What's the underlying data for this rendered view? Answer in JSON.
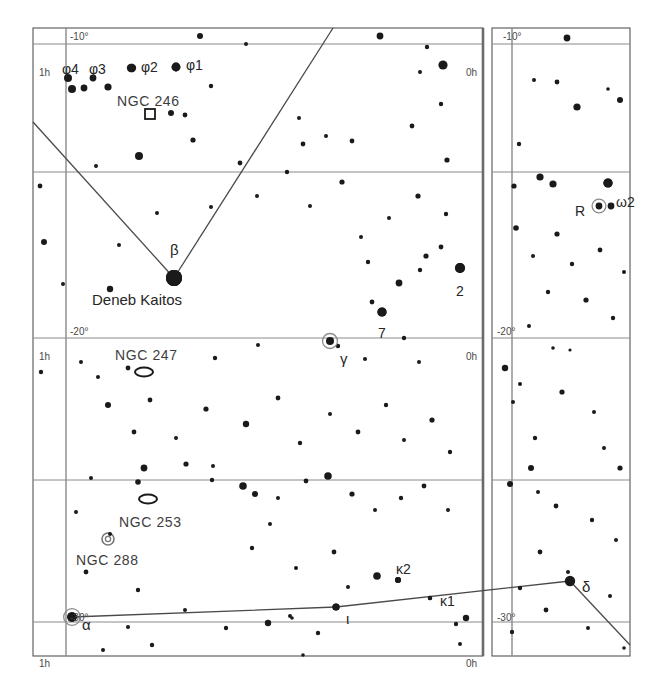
{
  "chart_data": {
    "type": "scatter",
    "xlabel": "Right Ascension",
    "ylabel": "Declination",
    "grid": true,
    "legend_position": "none",
    "xlim": [
      "1h",
      "0h"
    ],
    "ylim": [
      "-10",
      "-30"
    ],
    "panels": [
      {
        "name": "left-panel",
        "x": 33,
        "y": 28,
        "width": 450,
        "height": 628,
        "ra_labels": [
          "1h",
          "0h"
        ],
        "dec_labels": [
          "-10°",
          "-20°",
          "-30°"
        ]
      },
      {
        "name": "right-panel",
        "x": 492,
        "y": 28,
        "width": 138,
        "height": 628,
        "ra_labels": [
          "0h"
        ],
        "dec_labels": [
          "-10°",
          "-20°",
          "-30°"
        ]
      }
    ],
    "gridlines_horizontal": [
      {
        "label": "-10°",
        "y": 44
      },
      {
        "label": "",
        "y": 172
      },
      {
        "label": "-20°",
        "y": 338
      },
      {
        "label": "",
        "y": 480
      },
      {
        "label": "-30°",
        "y": 622
      }
    ],
    "gridlines_vertical": [
      {
        "label": "1h",
        "x": 66
      },
      {
        "label": "0h",
        "x": 466
      },
      {
        "label": "0h",
        "x": 512
      }
    ],
    "stars": [
      {
        "x": 72,
        "y": 89,
        "r": 4.0
      },
      {
        "x": 84,
        "y": 88,
        "r": 3.4
      },
      {
        "x": 108,
        "y": 87,
        "r": 3.6
      },
      {
        "x": 132,
        "y": 68,
        "r": 4.2
      },
      {
        "x": 176,
        "y": 67,
        "r": 4.4
      },
      {
        "x": 211,
        "y": 86,
        "r": 2.2
      },
      {
        "x": 200,
        "y": 36,
        "r": 3.0
      },
      {
        "x": 185,
        "y": 115,
        "r": 2.4
      },
      {
        "x": 171,
        "y": 113,
        "r": 3.0
      },
      {
        "x": 193,
        "y": 140,
        "r": 2.6
      },
      {
        "x": 246,
        "y": 44,
        "r": 2.0
      },
      {
        "x": 299,
        "y": 118,
        "r": 2.0
      },
      {
        "x": 303,
        "y": 144,
        "r": 2.4
      },
      {
        "x": 326,
        "y": 136,
        "r": 2.0
      },
      {
        "x": 380,
        "y": 36,
        "r": 3.4
      },
      {
        "x": 427,
        "y": 47,
        "r": 2.2
      },
      {
        "x": 443,
        "y": 65,
        "r": 4.6
      },
      {
        "x": 420,
        "y": 72,
        "r": 2.0
      },
      {
        "x": 139,
        "y": 156,
        "r": 4.0
      },
      {
        "x": 96,
        "y": 166,
        "r": 2.0
      },
      {
        "x": 40,
        "y": 186,
        "r": 2.4
      },
      {
        "x": 44,
        "y": 242,
        "r": 3.0
      },
      {
        "x": 63,
        "y": 284,
        "r": 2.0
      },
      {
        "x": 110,
        "y": 289,
        "r": 3.2
      },
      {
        "x": 119,
        "y": 245,
        "r": 2.0
      },
      {
        "x": 157,
        "y": 213,
        "r": 2.0
      },
      {
        "x": 174,
        "y": 278,
        "r": 8.0
      },
      {
        "x": 211,
        "y": 207,
        "r": 2.0
      },
      {
        "x": 240,
        "y": 163,
        "r": 2.4
      },
      {
        "x": 257,
        "y": 196,
        "r": 2.0
      },
      {
        "x": 287,
        "y": 172,
        "r": 2.2
      },
      {
        "x": 310,
        "y": 206,
        "r": 2.0
      },
      {
        "x": 342,
        "y": 182,
        "r": 2.6
      },
      {
        "x": 352,
        "y": 141,
        "r": 2.4
      },
      {
        "x": 361,
        "y": 237,
        "r": 2.0
      },
      {
        "x": 368,
        "y": 262,
        "r": 2.2
      },
      {
        "x": 372,
        "y": 302,
        "r": 2.4
      },
      {
        "x": 382,
        "y": 312,
        "r": 4.6
      },
      {
        "x": 399,
        "y": 283,
        "r": 3.4
      },
      {
        "x": 420,
        "y": 270,
        "r": 2.2
      },
      {
        "x": 426,
        "y": 256,
        "r": 2.6
      },
      {
        "x": 441,
        "y": 247,
        "r": 2.4
      },
      {
        "x": 460,
        "y": 268,
        "r": 5.0
      },
      {
        "x": 446,
        "y": 214,
        "r": 2.2
      },
      {
        "x": 418,
        "y": 196,
        "r": 2.6
      },
      {
        "x": 389,
        "y": 218,
        "r": 2.0
      },
      {
        "x": 447,
        "y": 160,
        "r": 2.6
      },
      {
        "x": 412,
        "y": 126,
        "r": 2.4
      },
      {
        "x": 441,
        "y": 104,
        "r": 2.2
      },
      {
        "x": 338,
        "y": 346,
        "r": 2.2
      },
      {
        "x": 404,
        "y": 338,
        "r": 2.2
      },
      {
        "x": 419,
        "y": 362,
        "r": 2.0
      },
      {
        "x": 365,
        "y": 359,
        "r": 2.0
      },
      {
        "x": 258,
        "y": 345,
        "r": 2.0
      },
      {
        "x": 215,
        "y": 358,
        "r": 2.2
      },
      {
        "x": 128,
        "y": 368,
        "r": 2.4
      },
      {
        "x": 98,
        "y": 377,
        "r": 2.0
      },
      {
        "x": 81,
        "y": 362,
        "r": 2.0
      },
      {
        "x": 41,
        "y": 372,
        "r": 2.2
      },
      {
        "x": 108,
        "y": 405,
        "r": 3.0
      },
      {
        "x": 150,
        "y": 400,
        "r": 2.4
      },
      {
        "x": 134,
        "y": 432,
        "r": 2.4
      },
      {
        "x": 176,
        "y": 438,
        "r": 2.0
      },
      {
        "x": 206,
        "y": 409,
        "r": 2.6
      },
      {
        "x": 246,
        "y": 424,
        "r": 3.2
      },
      {
        "x": 278,
        "y": 398,
        "r": 2.4
      },
      {
        "x": 300,
        "y": 443,
        "r": 2.2
      },
      {
        "x": 330,
        "y": 414,
        "r": 2.0
      },
      {
        "x": 358,
        "y": 432,
        "r": 2.4
      },
      {
        "x": 386,
        "y": 405,
        "r": 2.2
      },
      {
        "x": 404,
        "y": 440,
        "r": 2.0
      },
      {
        "x": 432,
        "y": 420,
        "r": 2.6
      },
      {
        "x": 450,
        "y": 452,
        "r": 2.2
      },
      {
        "x": 144,
        "y": 468,
        "r": 3.4
      },
      {
        "x": 186,
        "y": 464,
        "r": 2.6
      },
      {
        "x": 213,
        "y": 466,
        "r": 2.0
      },
      {
        "x": 91,
        "y": 478,
        "r": 2.0
      },
      {
        "x": 138,
        "y": 482,
        "r": 2.8
      },
      {
        "x": 212,
        "y": 480,
        "r": 2.2
      },
      {
        "x": 243,
        "y": 486,
        "r": 3.8
      },
      {
        "x": 255,
        "y": 494,
        "r": 3.0
      },
      {
        "x": 278,
        "y": 498,
        "r": 2.0
      },
      {
        "x": 306,
        "y": 481,
        "r": 2.4
      },
      {
        "x": 328,
        "y": 476,
        "r": 3.8
      },
      {
        "x": 352,
        "y": 494,
        "r": 2.6
      },
      {
        "x": 375,
        "y": 510,
        "r": 2.0
      },
      {
        "x": 401,
        "y": 498,
        "r": 2.2
      },
      {
        "x": 424,
        "y": 486,
        "r": 2.4
      },
      {
        "x": 448,
        "y": 510,
        "r": 2.0
      },
      {
        "x": 76,
        "y": 512,
        "r": 2.0
      },
      {
        "x": 86,
        "y": 572,
        "r": 2.4
      },
      {
        "x": 138,
        "y": 590,
        "r": 2.2
      },
      {
        "x": 110,
        "y": 534,
        "r": 2.0
      },
      {
        "x": 252,
        "y": 548,
        "r": 2.2
      },
      {
        "x": 270,
        "y": 524,
        "r": 2.0
      },
      {
        "x": 296,
        "y": 568,
        "r": 2.0
      },
      {
        "x": 334,
        "y": 552,
        "r": 2.4
      },
      {
        "x": 348,
        "y": 587,
        "r": 2.0
      },
      {
        "x": 377,
        "y": 576,
        "r": 3.8
      },
      {
        "x": 398,
        "y": 580,
        "r": 3.0
      },
      {
        "x": 430,
        "y": 598,
        "r": 2.2
      },
      {
        "x": 336,
        "y": 607,
        "r": 3.6
      },
      {
        "x": 185,
        "y": 610,
        "r": 2.0
      },
      {
        "x": 128,
        "y": 627,
        "r": 2.0
      },
      {
        "x": 72,
        "y": 617,
        "r": 4.8
      },
      {
        "x": 226,
        "y": 628,
        "r": 2.2
      },
      {
        "x": 268,
        "y": 623,
        "r": 3.2
      },
      {
        "x": 318,
        "y": 633,
        "r": 2.2
      },
      {
        "x": 290,
        "y": 616,
        "r": 2.0
      },
      {
        "x": 292,
        "y": 618,
        "r": 1.8
      },
      {
        "x": 456,
        "y": 624,
        "r": 2.2
      },
      {
        "x": 466,
        "y": 618,
        "r": 3.2
      },
      {
        "x": 103,
        "y": 650,
        "r": 2.0
      },
      {
        "x": 152,
        "y": 645,
        "r": 2.2
      },
      {
        "x": 303,
        "y": 655,
        "r": 1.8
      },
      {
        "x": 460,
        "y": 644,
        "r": 2.0
      },
      {
        "x": 567,
        "y": 38,
        "r": 3.4
      },
      {
        "x": 534,
        "y": 80,
        "r": 2.0
      },
      {
        "x": 557,
        "y": 82,
        "r": 2.4
      },
      {
        "x": 608,
        "y": 89,
        "r": 1.8
      },
      {
        "x": 620,
        "y": 100,
        "r": 3.0
      },
      {
        "x": 577,
        "y": 107,
        "r": 3.6
      },
      {
        "x": 519,
        "y": 144,
        "r": 2.2
      },
      {
        "x": 514,
        "y": 186,
        "r": 2.6
      },
      {
        "x": 540,
        "y": 177,
        "r": 3.6
      },
      {
        "x": 553,
        "y": 184,
        "r": 3.6
      },
      {
        "x": 608,
        "y": 183,
        "r": 4.6
      },
      {
        "x": 611,
        "y": 206,
        "r": 3.4
      },
      {
        "x": 516,
        "y": 228,
        "r": 2.8
      },
      {
        "x": 557,
        "y": 234,
        "r": 2.6
      },
      {
        "x": 533,
        "y": 256,
        "r": 2.0
      },
      {
        "x": 572,
        "y": 264,
        "r": 2.2
      },
      {
        "x": 600,
        "y": 250,
        "r": 2.4
      },
      {
        "x": 624,
        "y": 272,
        "r": 2.0
      },
      {
        "x": 548,
        "y": 292,
        "r": 2.2
      },
      {
        "x": 586,
        "y": 300,
        "r": 2.6
      },
      {
        "x": 613,
        "y": 318,
        "r": 2.2
      },
      {
        "x": 529,
        "y": 326,
        "r": 2.0
      },
      {
        "x": 553,
        "y": 348,
        "r": 1.8
      },
      {
        "x": 570,
        "y": 350,
        "r": 1.6
      },
      {
        "x": 505,
        "y": 368,
        "r": 3.2
      },
      {
        "x": 520,
        "y": 384,
        "r": 2.0
      },
      {
        "x": 562,
        "y": 392,
        "r": 2.6
      },
      {
        "x": 513,
        "y": 402,
        "r": 2.0
      },
      {
        "x": 594,
        "y": 412,
        "r": 2.0
      },
      {
        "x": 535,
        "y": 438,
        "r": 2.2
      },
      {
        "x": 604,
        "y": 448,
        "r": 2.0
      },
      {
        "x": 531,
        "y": 468,
        "r": 3.0
      },
      {
        "x": 620,
        "y": 468,
        "r": 2.6
      },
      {
        "x": 510,
        "y": 484,
        "r": 3.0
      },
      {
        "x": 538,
        "y": 492,
        "r": 2.0
      },
      {
        "x": 556,
        "y": 506,
        "r": 2.4
      },
      {
        "x": 592,
        "y": 520,
        "r": 2.2
      },
      {
        "x": 616,
        "y": 540,
        "r": 2.0
      },
      {
        "x": 540,
        "y": 552,
        "r": 2.4
      },
      {
        "x": 568,
        "y": 572,
        "r": 2.0
      },
      {
        "x": 520,
        "y": 588,
        "r": 2.2
      },
      {
        "x": 610,
        "y": 596,
        "r": 2.0
      },
      {
        "x": 546,
        "y": 610,
        "r": 2.4
      },
      {
        "x": 588,
        "y": 628,
        "r": 2.0
      },
      {
        "x": 512,
        "y": 632,
        "r": 2.2
      },
      {
        "x": 624,
        "y": 648,
        "r": 1.8
      }
    ],
    "labeled_stars": [
      {
        "name": "φ4",
        "x": 68,
        "y": 78,
        "label_dx": -6,
        "label_dy": -16,
        "r": 4.0
      },
      {
        "name": "φ3",
        "x": 93,
        "y": 78,
        "label_dx": -4,
        "label_dy": -16,
        "r": 3.4
      },
      {
        "name": "φ2",
        "x": 131,
        "y": 68,
        "label_dx": 10,
        "label_dy": -8,
        "r": 4.2
      },
      {
        "name": "φ1",
        "x": 176,
        "y": 67,
        "label_dx": 10,
        "label_dy": -9,
        "r": 4.4
      },
      {
        "name": "β",
        "x": 174,
        "y": 278,
        "label_dx": -4,
        "label_dy": -36,
        "r": 8.0
      },
      {
        "name": "Deneb Kaitos",
        "x": 174,
        "y": 278,
        "label_dx": -82,
        "label_dy": 14,
        "r": 8.0
      },
      {
        "name": "7",
        "x": 382,
        "y": 312,
        "label_dx": -4,
        "label_dy": 14,
        "r": 4.6
      },
      {
        "name": "2",
        "x": 460,
        "y": 268,
        "label_dx": -4,
        "label_dy": 16,
        "r": 5.0
      },
      {
        "name": "γ",
        "x": 330,
        "y": 341,
        "label_dx": 10,
        "label_dy": 10,
        "r": 4.0,
        "marker": "circled"
      },
      {
        "name": "κ2",
        "x": 398,
        "y": 580,
        "label_dx": -2,
        "label_dy": -18,
        "r": 3.0
      },
      {
        "name": "κ1",
        "x": 430,
        "y": 598,
        "label_dx": 10,
        "label_dy": -4,
        "r": 2.2
      },
      {
        "name": "ι",
        "x": 336,
        "y": 607,
        "label_dx": 10,
        "label_dy": 4,
        "r": 3.6
      },
      {
        "name": "α",
        "x": 72,
        "y": 617,
        "label_dx": 10,
        "label_dy": 0,
        "r": 4.8,
        "marker": "circled"
      },
      {
        "name": "δ",
        "x": 570,
        "y": 581,
        "label_dx": 12,
        "label_dy": -2,
        "r": 5.2
      },
      {
        "name": "R",
        "x": 599,
        "y": 206,
        "label_dx": -24,
        "label_dy": -2,
        "r": 3.4,
        "marker": "circled"
      },
      {
        "name": "ω2",
        "x": 608,
        "y": 183,
        "label_dx": 8,
        "label_dy": 12,
        "r": 4.6
      }
    ],
    "deep_sky_objects": [
      {
        "name": "NGC 246",
        "type": "planetary-nebula",
        "marker": "square",
        "mx": 150,
        "my": 114,
        "label_x": 117,
        "label_y": 94
      },
      {
        "name": "NGC 247",
        "type": "galaxy",
        "marker": "ellipse",
        "mx": 144,
        "my": 372,
        "label_x": 115,
        "label_y": 348
      },
      {
        "name": "NGC 253",
        "type": "galaxy",
        "marker": "ellipse",
        "mx": 148,
        "my": 499,
        "label_x": 119,
        "label_y": 515
      },
      {
        "name": "NGC 288",
        "type": "globular-cluster",
        "marker": "circle",
        "mx": 108,
        "my": 539,
        "label_x": 76,
        "label_y": 553
      }
    ],
    "constellation_lines": [
      {
        "name": "line-upper-left-to-beta",
        "points": [
          [
            33,
            122
          ],
          [
            174,
            278
          ]
        ]
      },
      {
        "name": "line-top-to-beta",
        "points": [
          [
            333,
            28
          ],
          [
            174,
            278
          ]
        ]
      },
      {
        "name": "line-alpha-to-delta",
        "points": [
          [
            72,
            617
          ],
          [
            336,
            607
          ],
          [
            570,
            581
          ]
        ]
      },
      {
        "name": "line-delta-outward",
        "points": [
          [
            570,
            581
          ],
          [
            630,
            645
          ]
        ]
      }
    ]
  },
  "axis_labels": {
    "left_panel": {
      "dec_top": "-10°",
      "dec_mid": "-20°",
      "dec_bottom": "-30°",
      "ra_left_top": "1h",
      "ra_left_mid": "1h",
      "ra_left_bottom": "1h",
      "ra_right_top": "0h",
      "ra_right_mid": "0h",
      "ra_right_bottom": "0h"
    },
    "right_panel": {
      "dec_top": "-10°",
      "dec_mid": "-20°",
      "dec_bottom": "-30°",
      "ra_bottom": "0h"
    }
  },
  "colors": {
    "background": "#ffffff",
    "star": "#1a1a1a",
    "grid": "#8a8a8a",
    "frame": "#555555",
    "meridian": "#6b6b6b",
    "line": "#4a4a4a",
    "text": "#2b2b2b"
  }
}
